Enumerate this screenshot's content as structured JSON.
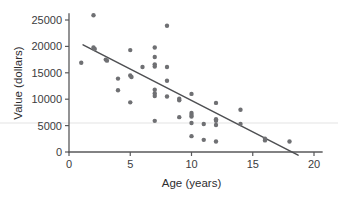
{
  "chart_data": {
    "type": "scatter",
    "title": "",
    "xlabel": "Age (years)",
    "ylabel": "Value (dollars)",
    "xlim": [
      0,
      20
    ],
    "ylim": [
      0,
      27000
    ],
    "xticks": [
      0,
      5,
      10,
      15,
      20
    ],
    "yticks": [
      0,
      5000,
      10000,
      15000,
      20000,
      25000
    ],
    "xtick_labels": [
      "0",
      "5",
      "10",
      "15",
      "20"
    ],
    "ytick_labels": [
      "0",
      "5000",
      "10000",
      "15000",
      "20000",
      "25000"
    ],
    "grid": false,
    "legend": "none",
    "point_color": "#6f7073",
    "line_color": "#4e4f52",
    "axis_color": "#58585a",
    "points": [
      {
        "x": 1.0,
        "y": 16900
      },
      {
        "x": 2.0,
        "y": 25900
      },
      {
        "x": 2.0,
        "y": 19800
      },
      {
        "x": 2.1,
        "y": 19500
      },
      {
        "x": 3.0,
        "y": 17500
      },
      {
        "x": 3.1,
        "y": 17300
      },
      {
        "x": 4.0,
        "y": 13900
      },
      {
        "x": 4.0,
        "y": 11700
      },
      {
        "x": 5.0,
        "y": 19300
      },
      {
        "x": 5.0,
        "y": 14500
      },
      {
        "x": 5.1,
        "y": 14200
      },
      {
        "x": 5.0,
        "y": 9400
      },
      {
        "x": 6.0,
        "y": 16100
      },
      {
        "x": 7.0,
        "y": 19800
      },
      {
        "x": 7.0,
        "y": 18000
      },
      {
        "x": 7.0,
        "y": 16600
      },
      {
        "x": 7.0,
        "y": 16200
      },
      {
        "x": 7.0,
        "y": 11800
      },
      {
        "x": 7.0,
        "y": 11100
      },
      {
        "x": 7.0,
        "y": 10600
      },
      {
        "x": 7.0,
        "y": 5900
      },
      {
        "x": 8.0,
        "y": 23900
      },
      {
        "x": 8.0,
        "y": 16100
      },
      {
        "x": 8.0,
        "y": 13500
      },
      {
        "x": 8.0,
        "y": 10500
      },
      {
        "x": 9.0,
        "y": 10100
      },
      {
        "x": 9.0,
        "y": 9800
      },
      {
        "x": 9.0,
        "y": 6600
      },
      {
        "x": 10.0,
        "y": 11000
      },
      {
        "x": 10.0,
        "y": 7400
      },
      {
        "x": 10.0,
        "y": 7000
      },
      {
        "x": 10.0,
        "y": 6700
      },
      {
        "x": 10.0,
        "y": 5500
      },
      {
        "x": 10.0,
        "y": 3000
      },
      {
        "x": 11.0,
        "y": 5300
      },
      {
        "x": 11.0,
        "y": 2300
      },
      {
        "x": 12.0,
        "y": 9300
      },
      {
        "x": 12.0,
        "y": 6200
      },
      {
        "x": 12.0,
        "y": 5900
      },
      {
        "x": 12.0,
        "y": 5100
      },
      {
        "x": 12.0,
        "y": 2000
      },
      {
        "x": 14.0,
        "y": 8000
      },
      {
        "x": 14.0,
        "y": 5300
      },
      {
        "x": 16.0,
        "y": 2500
      },
      {
        "x": 16.0,
        "y": 2200
      },
      {
        "x": 18.0,
        "y": 2000
      }
    ],
    "trend_line": {
      "x0": 1.15,
      "y0": 20300,
      "x1": 18.7,
      "y1": -600
    }
  }
}
